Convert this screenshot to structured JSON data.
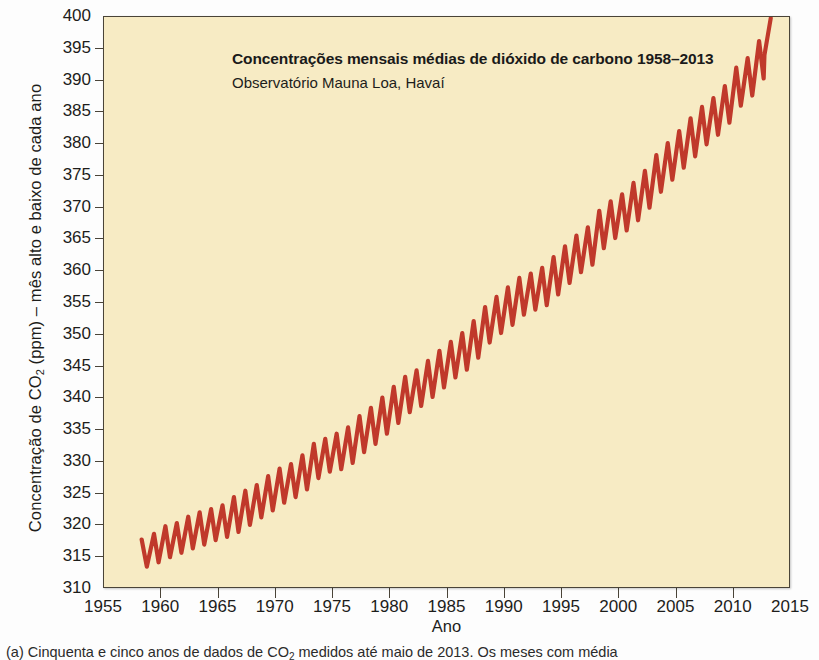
{
  "figure": {
    "caption": "(a) Cinquenta e cinco anos de dados de CO2 medidos até maio de 2013. Os meses com média",
    "caption_prefix": "(a) Cinquenta e cinco anos de dados de CO",
    "caption_sub": "2",
    "caption_suffix": " medidos até maio de 2013. Os meses com média"
  },
  "colors": {
    "plot_background": "#f7ebc4",
    "line": "#c0392b",
    "axis": "#4a4438",
    "text": "#1d1d1b"
  },
  "chart_data": {
    "type": "line",
    "title": "Concentrações mensais médias de dióxido de carbono 1958–2013",
    "subtitle": "Observatório Mauna Loa, Havaí",
    "xlabel": "Ano",
    "ylabel_prefix": "Concentração de CO",
    "ylabel_sub": "2",
    "ylabel_suffix": " (ppm) – mês alto e baixo de cada ano",
    "ylabel": "Concentração de CO2 (ppm) – mês alto e baixo de cada ano",
    "xlim": [
      1955,
      2015
    ],
    "ylim": [
      310,
      400
    ],
    "xticks": [
      1955,
      1960,
      1965,
      1970,
      1975,
      1980,
      1985,
      1990,
      1995,
      2000,
      2005,
      2010,
      2015
    ],
    "yticks": [
      310,
      315,
      320,
      325,
      330,
      335,
      340,
      345,
      350,
      355,
      360,
      365,
      370,
      375,
      380,
      385,
      390,
      395,
      400
    ],
    "grid": false,
    "legend": "none",
    "series": [
      {
        "name": "CO2 mensal – Mauna Loa",
        "color": "#c0392b",
        "description": "Curva serrilhada ascendente: máximo e mínimo mensal de cada ano, de 1958 a maio de 2013.",
        "x": [
          1958.3,
          1959,
          1960,
          1961,
          1962,
          1963,
          1964,
          1965,
          1966,
          1967,
          1968,
          1969,
          1970,
          1971,
          1972,
          1973,
          1974,
          1975,
          1976,
          1977,
          1978,
          1979,
          1980,
          1981,
          1982,
          1983,
          1984,
          1985,
          1986,
          1987,
          1988,
          1989,
          1990,
          1991,
          1992,
          1993,
          1994,
          1995,
          1996,
          1997,
          1998,
          1999,
          2000,
          2001,
          2002,
          2003,
          2004,
          2005,
          2006,
          2007,
          2008,
          2009,
          2010,
          2011,
          2012,
          2013.4
        ],
        "annual_max": [
          317.5,
          318.4,
          319.6,
          320.1,
          321.1,
          321.8,
          322.3,
          322.9,
          324.2,
          325.2,
          326.1,
          327.5,
          328.7,
          329.4,
          330.8,
          332.6,
          333.4,
          334.2,
          335.2,
          337.0,
          338.3,
          339.9,
          341.6,
          343.2,
          344.2,
          345.7,
          347.3,
          348.7,
          350.1,
          352.0,
          354.2,
          355.8,
          357.3,
          358.8,
          359.5,
          360.4,
          362.1,
          363.8,
          365.5,
          366.8,
          369.4,
          370.9,
          372.0,
          373.8,
          375.7,
          378.2,
          380.1,
          382.0,
          384.0,
          385.8,
          387.2,
          389.1,
          392.0,
          393.5,
          396.2,
          399.8
        ],
        "annual_min": [
          313.2,
          313.9,
          314.7,
          315.4,
          316.1,
          316.7,
          317.4,
          317.9,
          318.7,
          319.8,
          321.0,
          322.1,
          323.3,
          324.2,
          325.4,
          327.2,
          328.2,
          328.6,
          329.6,
          331.3,
          332.6,
          334.2,
          335.9,
          337.6,
          338.6,
          340.0,
          341.5,
          343.1,
          344.3,
          346.2,
          348.6,
          350.1,
          351.4,
          353.0,
          353.8,
          354.5,
          356.2,
          358.0,
          359.7,
          360.9,
          363.5,
          365.1,
          366.3,
          367.9,
          369.9,
          372.4,
          374.3,
          376.2,
          378.0,
          379.9,
          381.4,
          383.3,
          386.0,
          387.6,
          390.3,
          394.0
        ]
      }
    ]
  }
}
